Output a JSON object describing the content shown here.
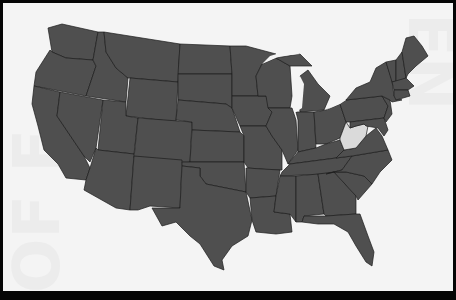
{
  "map": {
    "title": "United States",
    "highlighted_state": "West Virginia",
    "colors": {
      "state_fill": "#4f4f4f",
      "border": "#1c1c1c",
      "highlight_fill": "#dadada",
      "background": "#f4f4f4",
      "frame": "#050505"
    },
    "watermark": {
      "left": "OF F",
      "right": "EN"
    }
  }
}
